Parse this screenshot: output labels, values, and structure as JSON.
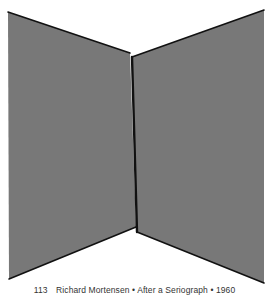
{
  "artwork": {
    "description": "Two gray quadrilateral panels forming an open-book / folded-screen shape",
    "colors": {
      "panel_fill": "#787878",
      "edge_stroke": "#111111",
      "background": "#ffffff"
    },
    "left_panel": {
      "points": "8,12 130,53 136,227 9,279"
    },
    "right_panel": {
      "points": "132,57 264,10 264,283 137,232"
    }
  },
  "caption": {
    "number": "113",
    "artist": "Richard Mortensen",
    "separator": "•",
    "title": "After a Seriograph",
    "year": "1960"
  }
}
